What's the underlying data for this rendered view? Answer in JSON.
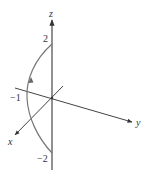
{
  "diagram": {
    "axes": {
      "x": {
        "label": "x"
      },
      "y": {
        "label": "y"
      },
      "z": {
        "label": "z"
      }
    },
    "tick_labels": {
      "z_top": "2",
      "z_bottom": "−2",
      "x_neg": "−1"
    },
    "colors": {
      "axis": "#444444",
      "curve": "#777777",
      "text": "#333333",
      "background": "#ffffff"
    },
    "curve": {
      "description": "Arc from (0,0,-2) through (-1,0,0) to (0,0,2), oriented upward",
      "direction_arrow": "up"
    }
  }
}
